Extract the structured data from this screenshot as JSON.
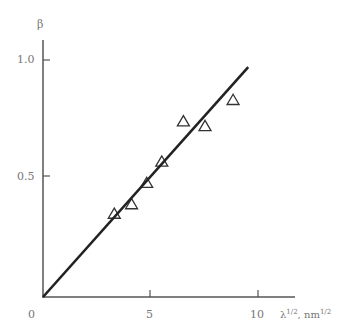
{
  "chart_data": {
    "type": "scatter",
    "title": "",
    "xlabel": "λ^1/2, nm^1/2",
    "ylabel": "β",
    "xlim": [
      0,
      11.5
    ],
    "ylim": [
      0,
      1.0
    ],
    "x_ticks": [
      "0",
      "5",
      "10"
    ],
    "y_ticks": [
      "0.5",
      "1.0"
    ],
    "grid": false,
    "legend": null,
    "series": [
      {
        "name": "data",
        "marker": "open-triangle",
        "points": [
          {
            "x": 3.3,
            "y": 0.35
          },
          {
            "x": 4.1,
            "y": 0.39
          },
          {
            "x": 4.8,
            "y": 0.48
          },
          {
            "x": 5.5,
            "y": 0.57
          },
          {
            "x": 6.5,
            "y": 0.74
          },
          {
            "x": 7.5,
            "y": 0.72
          },
          {
            "x": 8.8,
            "y": 0.83
          }
        ]
      },
      {
        "name": "fit",
        "type": "line",
        "points": [
          {
            "x": 0,
            "y": 0
          },
          {
            "x": 9.5,
            "y": 0.97
          }
        ]
      }
    ]
  },
  "labels": {
    "ylabel": "β",
    "xlabel_main": "λ",
    "xlabel_sup": "1/2",
    "xlabel_unit": ", nm",
    "xlabel_unit_sup": "1/2",
    "origin": "0",
    "x5": "5",
    "x10": "10",
    "y05": "0.5",
    "y10": "1.0"
  }
}
